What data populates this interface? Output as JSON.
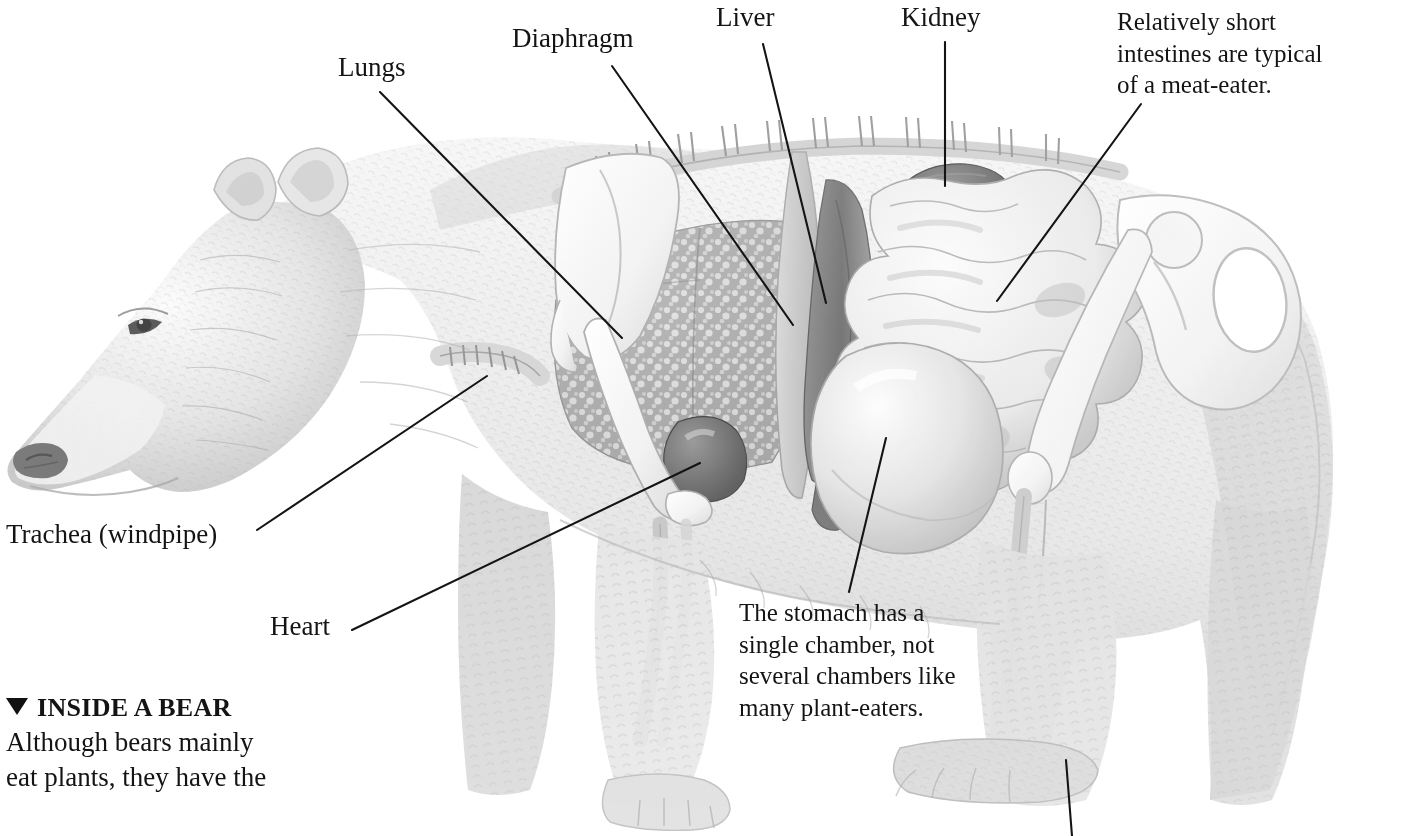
{
  "figure": {
    "kind": "anatomical-illustration",
    "subject": "bear",
    "style": "graphite pencil cutaway drawing",
    "background_color": "#ffffff",
    "ink_color": "#141414"
  },
  "labels": [
    {
      "id": "lungs",
      "text": "Lungs",
      "x": 338,
      "y": 54,
      "line": [
        380,
        92,
        622,
        338
      ]
    },
    {
      "id": "diaphragm",
      "text": "Diaphragm",
      "x": 512,
      "y": 25,
      "line": [
        612,
        66,
        793,
        325
      ]
    },
    {
      "id": "liver",
      "text": "Liver",
      "x": 716,
      "y": 4,
      "line": [
        763,
        44,
        826,
        303
      ]
    },
    {
      "id": "kidney",
      "text": "Kidney",
      "x": 901,
      "y": 4,
      "line": [
        945,
        42,
        945,
        186
      ]
    },
    {
      "id": "trachea",
      "text": "Trachea (windpipe)",
      "x": 6,
      "y": 521,
      "line": [
        257,
        530,
        487,
        376
      ]
    },
    {
      "id": "heart",
      "text": "Heart",
      "x": 270,
      "y": 613,
      "line": [
        352,
        630,
        700,
        463
      ]
    }
  ],
  "notes": [
    {
      "id": "intestines-note",
      "lines": [
        "Relatively short",
        "intestines are typical",
        "of a meat-eater."
      ],
      "x": 1117,
      "y": 6,
      "width": 300,
      "line": [
        1141,
        104,
        997,
        301
      ]
    },
    {
      "id": "stomach-note",
      "lines": [
        "The stomach has a",
        "single chamber, not",
        "several chambers like",
        "many plant-eaters."
      ],
      "x": 739,
      "y": 597,
      "width": 260,
      "line": [
        886,
        438,
        849,
        592
      ]
    }
  ],
  "caption": {
    "marker": "triangle-up",
    "heading": "INSIDE A BEAR",
    "body_lines": [
      "Although bears mainly",
      "eat plants, they have the"
    ],
    "x": 6,
    "y": 690
  },
  "pointers": [
    {
      "id": "hind-paw-pointer",
      "line": [
        1066,
        760,
        1072,
        836
      ]
    }
  ],
  "organs": [
    "lungs",
    "heart",
    "liver",
    "diaphragm",
    "stomach",
    "kidney",
    "intestines",
    "trachea",
    "spine",
    "ribs",
    "scapula",
    "humerus",
    "pelvis",
    "femur",
    "tibia"
  ]
}
